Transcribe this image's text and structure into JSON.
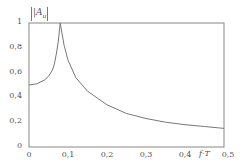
{
  "chart_data": {
    "type": "line",
    "title": "",
    "ylabel": "|A_u|",
    "xlabel": "f·T",
    "xlim": [
      0,
      0.5
    ],
    "ylim": [
      0,
      1
    ],
    "grid": false,
    "x_ticks": [
      "0",
      "0,1",
      "0,2",
      "0,3",
      "0,4",
      "0,5"
    ],
    "y_ticks": [
      "0",
      "0,2",
      "0,4",
      "0,6",
      "0,8",
      "1"
    ],
    "series": [
      {
        "name": "|A_u|",
        "x": [
          0,
          0.02,
          0.04,
          0.05,
          0.06,
          0.065,
          0.07,
          0.075,
          0.08,
          0.09,
          0.1,
          0.12,
          0.15,
          0.2,
          0.25,
          0.3,
          0.35,
          0.4,
          0.45,
          0.5
        ],
        "values": [
          0.5,
          0.51,
          0.54,
          0.57,
          0.62,
          0.67,
          0.75,
          0.85,
          1.0,
          0.82,
          0.7,
          0.56,
          0.45,
          0.34,
          0.27,
          0.23,
          0.2,
          0.18,
          0.165,
          0.15
        ]
      }
    ],
    "reference_line": {
      "y": 1,
      "style": "solid"
    }
  },
  "labels": {
    "y_axis": "|A",
    "y_axis_sub": "u",
    "x_axis": "f·T"
  }
}
